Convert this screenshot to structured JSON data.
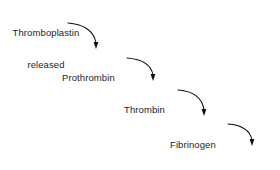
{
  "diagram": {
    "type": "flow-cascade",
    "background_color": "#ffffff",
    "text_color": "#1d1d1d",
    "arrow_color": "#111111",
    "nodes": [
      {
        "id": "thromboplastin",
        "lines": [
          "Thromboplastin",
          "released"
        ],
        "label": "Thromboplastin released",
        "x": 4,
        "y": 7,
        "align": "center",
        "width": 84
      },
      {
        "id": "prothrombin",
        "lines": [
          "Prothrombin"
        ],
        "label": "Prothrombin",
        "x": 62,
        "y": 52,
        "align": "left",
        "width": 62
      },
      {
        "id": "thrombin",
        "lines": [
          "Thrombin"
        ],
        "label": "Thrombin",
        "x": 124,
        "y": 84,
        "align": "left",
        "width": 50
      },
      {
        "id": "fibrinogen",
        "lines": [
          "Fibrinogen"
        ],
        "label": "Fibrinogen",
        "x": 170,
        "y": 119,
        "align": "left",
        "width": 54
      },
      {
        "id": "fibrin_clot",
        "lines": [
          "Fibrin clot"
        ],
        "label": "Fibrin clot",
        "x": 226,
        "y": 149,
        "align": "left",
        "width": 52
      }
    ],
    "arrows": [
      {
        "id": "arrow-thromboplastin-to-prothrombin",
        "from": "thromboplastin",
        "to": "prothrombin",
        "path": "M 68 23 C 82 24 94 30 96 43",
        "head_x": 96,
        "head_y": 49
      },
      {
        "id": "arrow-prothrombin-to-thrombin",
        "from": "prothrombin",
        "to": "thrombin",
        "path": "M 127 58 C 141 59 151 64 153 75",
        "head_x": 153,
        "head_y": 81
      },
      {
        "id": "arrow-thrombin-to-fibrinogen",
        "from": "thrombin",
        "to": "fibrinogen",
        "path": "M 178 90 C 192 91 202 96 204 110",
        "head_x": 204,
        "head_y": 116
      },
      {
        "id": "arrow-fibrinogen-to-fibrin-clot",
        "from": "fibrinogen",
        "to": "fibrin_clot",
        "path": "M 228 124 C 242 125 250 130 252 140",
        "head_x": 252,
        "head_y": 146
      }
    ]
  }
}
